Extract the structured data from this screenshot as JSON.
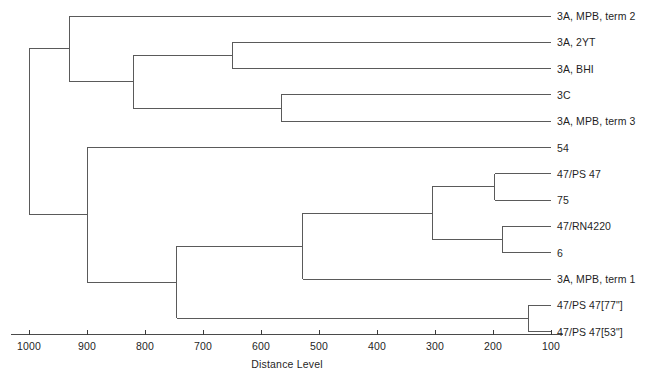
{
  "chart_data": {
    "type": "dendrogram",
    "title": "",
    "xlabel": "Distance Level",
    "ylabel": "",
    "xlim": [
      1030,
      90
    ],
    "x_reversed": true,
    "grid": false,
    "legend": null,
    "tick_labels": [
      "1000",
      "900",
      "800",
      "700",
      "600",
      "500",
      "400",
      "300",
      "200",
      "100"
    ],
    "tick_values": [
      1000,
      900,
      800,
      700,
      600,
      500,
      400,
      300,
      200,
      100
    ],
    "leaf_labels": [
      "3A, MPB, term 2",
      "3A, 2YT",
      "3A, BHI",
      "3C",
      "3A, MPB, term 3",
      "54",
      "47/PS 47",
      "75",
      "47/RN4220",
      "6",
      "3A, MPB, term 1",
      "47/PS 47[77\"]",
      "47/PS 47[53\"]"
    ],
    "leaf_order": [
      0,
      1,
      2,
      3,
      4,
      5,
      6,
      7,
      8,
      9,
      10,
      11,
      12
    ],
    "leaf_tip_distance": 100,
    "merges": [
      {
        "id": "n1",
        "members": [
          "3A, 2YT",
          "3A, BHI"
        ],
        "distance": 650
      },
      {
        "id": "n2",
        "members": [
          "3C",
          "3A, MPB, term 3"
        ],
        "distance": 565
      },
      {
        "id": "n3",
        "members": [
          "n1",
          "n2"
        ],
        "distance": 820
      },
      {
        "id": "n4",
        "members": [
          "3A, MPB, term 2",
          "n3"
        ],
        "distance": 930
      },
      {
        "id": "n5",
        "members": [
          "47/PS 47",
          "75"
        ],
        "distance": 197
      },
      {
        "id": "n6",
        "members": [
          "47/RN4220",
          "6"
        ],
        "distance": 183
      },
      {
        "id": "n7",
        "members": [
          "n5",
          "n6"
        ],
        "distance": 305
      },
      {
        "id": "n8",
        "members": [
          "n7",
          "3A, MPB, term 1"
        ],
        "distance": 528
      },
      {
        "id": "n9",
        "members": [
          "47/PS 47[77\"]",
          "47/PS 47[53\"]"
        ],
        "distance": 138
      },
      {
        "id": "n10",
        "members": [
          "n8",
          "n9"
        ],
        "distance": 745
      },
      {
        "id": "n11",
        "members": [
          "54",
          "n10"
        ],
        "distance": 900
      },
      {
        "id": "n12",
        "members": [
          "n4",
          "n11"
        ],
        "distance": 1000
      }
    ],
    "line_color": "#5a5a5a",
    "axis_color": "#4a4a4a",
    "background_color": "#ffffff"
  }
}
